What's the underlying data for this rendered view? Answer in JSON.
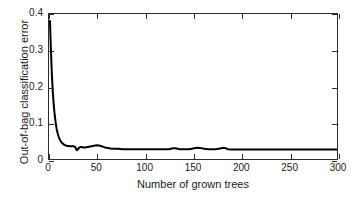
{
  "chart_data": {
    "type": "line",
    "title": "",
    "xlabel": "Number of grown trees",
    "ylabel": "Out-of-bag classification error",
    "xlim": [
      0,
      300
    ],
    "ylim": [
      0,
      0.4
    ],
    "xticks": [
      0,
      50,
      100,
      150,
      200,
      250,
      300
    ],
    "xtick_labels": [
      "0",
      "50",
      "100",
      "150",
      "200",
      "250",
      "300"
    ],
    "yticks": [
      0,
      0.1,
      0.2,
      0.3,
      0.4
    ],
    "ytick_labels": [
      "0",
      "0.1",
      "0.2",
      "0.3",
      "0.4"
    ],
    "grid": false,
    "legend": null,
    "line_color": "#000000",
    "line_width": 2,
    "series": [
      {
        "name": "Out-of-bag classification error",
        "x": [
          1,
          2,
          3,
          4,
          5,
          6,
          7,
          8,
          9,
          10,
          11,
          12,
          13,
          14,
          15,
          16,
          17,
          18,
          19,
          20,
          22,
          24,
          26,
          27,
          28,
          29,
          30,
          31,
          32,
          33,
          34,
          36,
          38,
          40,
          42,
          44,
          46,
          48,
          50,
          52,
          54,
          56,
          58,
          60,
          64,
          68,
          72,
          76,
          80,
          85,
          90,
          95,
          100,
          105,
          110,
          115,
          120,
          125,
          128,
          130,
          133,
          136,
          140,
          143,
          146,
          150,
          154,
          158,
          162,
          166,
          170,
          174,
          178,
          182,
          184,
          186,
          190,
          200,
          210,
          220,
          230,
          240,
          250,
          260,
          270,
          280,
          290,
          300
        ],
        "y": [
          0.381,
          0.3,
          0.232,
          0.183,
          0.147,
          0.12,
          0.099,
          0.083,
          0.071,
          0.062,
          0.055,
          0.05,
          0.046,
          0.043,
          0.041,
          0.039,
          0.038,
          0.037,
          0.036,
          0.036,
          0.035,
          0.035,
          0.035,
          0.034,
          0.029,
          0.024,
          0.026,
          0.03,
          0.032,
          0.033,
          0.033,
          0.032,
          0.032,
          0.033,
          0.034,
          0.035,
          0.036,
          0.037,
          0.038,
          0.037,
          0.036,
          0.034,
          0.032,
          0.031,
          0.029,
          0.028,
          0.028,
          0.027,
          0.027,
          0.027,
          0.027,
          0.027,
          0.027,
          0.027,
          0.027,
          0.027,
          0.027,
          0.027,
          0.029,
          0.03,
          0.029,
          0.027,
          0.027,
          0.027,
          0.027,
          0.029,
          0.031,
          0.03,
          0.028,
          0.027,
          0.027,
          0.027,
          0.029,
          0.031,
          0.03,
          0.027,
          0.026,
          0.026,
          0.026,
          0.026,
          0.026,
          0.026,
          0.026,
          0.026,
          0.026,
          0.026,
          0.026,
          0.026
        ]
      }
    ]
  }
}
